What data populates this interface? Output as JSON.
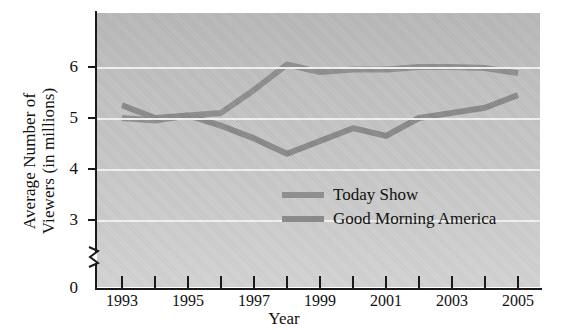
{
  "chart_data": {
    "type": "line",
    "title": "",
    "xlabel": "Year",
    "ylabel": "Average Number of Viewers (in millions)",
    "ylabel_line1": "Average Number of",
    "ylabel_line2": "Viewers (in millions)",
    "x": [
      1993,
      1994,
      1995,
      1996,
      1997,
      1998,
      1999,
      2000,
      2001,
      2002,
      2003,
      2004,
      2005
    ],
    "xtick_labels": [
      "1993",
      "",
      "1995",
      "",
      "1997",
      "",
      "1999",
      "",
      "2001",
      "",
      "2003",
      "",
      "2005"
    ],
    "ytick_labels": [
      "6",
      "5",
      "4",
      "3",
      "0"
    ],
    "yticks": [
      6,
      5,
      4,
      3,
      0
    ],
    "ylim": [
      2.6,
      6.6
    ],
    "axis_break": true,
    "grid": "horizontal",
    "legend_position": "inside-lower-right",
    "series": [
      {
        "name": "Today Show",
        "color": "#8f8f8f",
        "values": [
          5.0,
          4.95,
          5.05,
          5.1,
          5.55,
          6.05,
          5.9,
          5.95,
          5.95,
          6.0,
          6.0,
          5.98,
          5.88
        ]
      },
      {
        "name": "Good Morning America",
        "color": "#8a8a8a",
        "values": [
          5.25,
          5.0,
          5.05,
          4.85,
          4.6,
          4.3,
          4.55,
          4.8,
          4.65,
          5.0,
          5.1,
          5.2,
          5.45
        ]
      }
    ]
  },
  "legend": {
    "items": [
      {
        "label": "Today Show",
        "color": "#8f8f8f"
      },
      {
        "label": "Good Morning America",
        "color": "#8a8a8a"
      }
    ]
  }
}
